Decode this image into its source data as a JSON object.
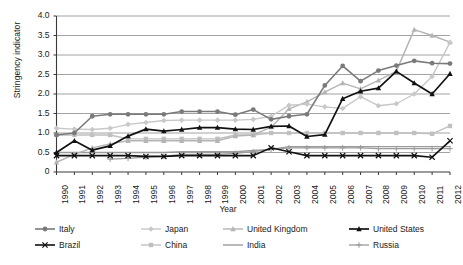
{
  "chart_data": {
    "type": "line",
    "title": "",
    "xlabel": "Year",
    "ylabel": "Stringency indicator",
    "x": [
      1990,
      1991,
      1992,
      1993,
      1994,
      1995,
      1996,
      1997,
      1998,
      1999,
      2000,
      2001,
      2002,
      2003,
      2004,
      2005,
      2006,
      2007,
      2008,
      2009,
      2010,
      2011,
      2012
    ],
    "xlim": [
      1990,
      2012
    ],
    "ylim": [
      0,
      4.0
    ],
    "yticks": [
      "0",
      "0.5",
      "1.0",
      "1.5",
      "2.0",
      "2.5",
      "3.0",
      "3.5",
      "4.0"
    ],
    "ytick_values": [
      0,
      0.5,
      1.0,
      1.5,
      2.0,
      2.5,
      3.0,
      3.5,
      4.0
    ],
    "xticks": [
      "1990",
      "1991",
      "1992",
      "1993",
      "1994",
      "1995",
      "1996",
      "1997",
      "1998",
      "1999",
      "2000",
      "2001",
      "2002",
      "2003",
      "2004",
      "2005",
      "2006",
      "2007",
      "2008",
      "2009",
      "2010",
      "2011",
      "2012"
    ],
    "grid": "horizontal",
    "legend_position": "bottom",
    "series": [
      {
        "name": "Italy",
        "color": "#7a7a7a",
        "marker": "circle",
        "marker_color": "#7a7a7a",
        "width": 1.6,
        "values": [
          0.95,
          1.0,
          1.43,
          1.48,
          1.48,
          1.48,
          1.48,
          1.55,
          1.55,
          1.55,
          1.47,
          1.6,
          1.35,
          1.43,
          1.48,
          2.22,
          2.72,
          2.33,
          2.6,
          2.73,
          2.85,
          2.79,
          2.78
        ]
      },
      {
        "name": "Japan",
        "color": "#c8c8c8",
        "marker": "diamond",
        "marker_color": "#c8c8c8",
        "width": 1.4,
        "values": [
          1.12,
          1.1,
          1.09,
          1.12,
          1.22,
          1.27,
          1.32,
          1.33,
          1.33,
          1.33,
          1.33,
          1.35,
          1.43,
          1.71,
          1.74,
          1.67,
          1.63,
          1.93,
          1.7,
          1.75,
          2.0,
          2.45,
          3.32
        ]
      },
      {
        "name": "United Kingdom",
        "color": "#b4b4b4",
        "marker": "triangle",
        "marker_color": "#b4b4b4",
        "width": 1.4,
        "values": [
          0.25,
          0.45,
          0.62,
          0.72,
          0.8,
          0.8,
          0.8,
          0.8,
          0.8,
          0.8,
          0.92,
          0.95,
          1.15,
          1.62,
          1.8,
          2.05,
          2.28,
          2.13,
          2.35,
          2.58,
          3.65,
          3.5,
          3.33
        ]
      },
      {
        "name": "United States",
        "color": "#111111",
        "marker": "triangle-filled",
        "marker_color": "#111111",
        "width": 1.7,
        "values": [
          0.5,
          0.8,
          0.56,
          0.67,
          0.92,
          1.1,
          1.05,
          1.09,
          1.14,
          1.14,
          1.1,
          1.09,
          1.17,
          1.18,
          0.91,
          0.96,
          1.88,
          2.07,
          2.15,
          2.58,
          2.28,
          2.0,
          2.52
        ]
      },
      {
        "name": "Brazil",
        "color": "#111111",
        "marker": "x",
        "marker_color": "#111111",
        "width": 1.6,
        "values": [
          0.42,
          0.42,
          0.42,
          0.42,
          0.42,
          0.4,
          0.4,
          0.42,
          0.42,
          0.42,
          0.42,
          0.42,
          0.62,
          0.52,
          0.42,
          0.42,
          0.42,
          0.42,
          0.42,
          0.42,
          0.42,
          0.38,
          0.8
        ]
      },
      {
        "name": "China",
        "color": "#c0c0c0",
        "marker": "square",
        "marker_color": "#c0c0c0",
        "width": 1.4,
        "values": [
          0.95,
          0.95,
          0.95,
          0.95,
          0.85,
          0.85,
          0.85,
          0.85,
          0.85,
          0.85,
          0.95,
          0.95,
          1.0,
          1.0,
          1.0,
          1.0,
          1.0,
          1.0,
          1.0,
          1.0,
          1.0,
          0.98,
          1.18
        ]
      },
      {
        "name": "India",
        "color": "#9b9b9b",
        "marker": "none",
        "marker_color": "#9b9b9b",
        "width": 1.4,
        "values": [
          0.5,
          0.5,
          0.5,
          0.5,
          0.5,
          0.5,
          0.5,
          0.52,
          0.52,
          0.52,
          0.52,
          0.55,
          0.58,
          0.65,
          0.65,
          0.65,
          0.65,
          0.65,
          0.65,
          0.65,
          0.65,
          0.65,
          0.65
        ]
      },
      {
        "name": "Russia",
        "color": "#9b9b9b",
        "marker": "plus",
        "marker_color": "#9b9b9b",
        "width": 1.3,
        "values": [
          null,
          null,
          null,
          0.33,
          0.35,
          0.38,
          0.4,
          0.45,
          0.45,
          0.45,
          0.48,
          0.52,
          0.58,
          0.62,
          0.62,
          0.62,
          0.62,
          0.62,
          0.6,
          0.6,
          0.6,
          0.6,
          0.6
        ]
      }
    ]
  },
  "legend": {
    "items": [
      {
        "label": "Italy"
      },
      {
        "label": "Japan"
      },
      {
        "label": "United Kingdom"
      },
      {
        "label": "United States"
      },
      {
        "label": "Brazil"
      },
      {
        "label": "China"
      },
      {
        "label": "India"
      },
      {
        "label": "Russia"
      }
    ]
  },
  "axes": {
    "y_title": "Stringency indicator",
    "x_title": "Year"
  },
  "colors": {
    "axis": "#3a3a3a",
    "grid": "#8c8c8c",
    "background": "#ffffff"
  }
}
